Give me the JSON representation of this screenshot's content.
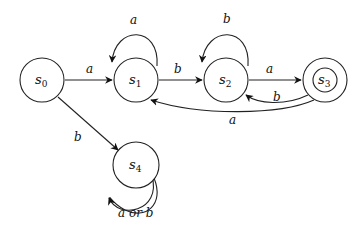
{
  "diagram": {
    "type": "finite-state-automaton",
    "states": [
      {
        "id": "s0",
        "name": "s",
        "sub": "0",
        "accepting": false,
        "start": true
      },
      {
        "id": "s1",
        "name": "s",
        "sub": "1",
        "accepting": false
      },
      {
        "id": "s2",
        "name": "s",
        "sub": "2",
        "accepting": false
      },
      {
        "id": "s3",
        "name": "s",
        "sub": "3",
        "accepting": true
      },
      {
        "id": "s4",
        "name": "s",
        "sub": "4",
        "accepting": false
      }
    ],
    "transitions": [
      {
        "from": "s0",
        "to": "s1",
        "label": "a"
      },
      {
        "from": "s0",
        "to": "s4",
        "label": "b"
      },
      {
        "from": "s1",
        "to": "s1",
        "label": "a"
      },
      {
        "from": "s1",
        "to": "s2",
        "label": "b"
      },
      {
        "from": "s2",
        "to": "s2",
        "label": "b"
      },
      {
        "from": "s2",
        "to": "s3",
        "label": "a"
      },
      {
        "from": "s3",
        "to": "s2",
        "label": "b"
      },
      {
        "from": "s3",
        "to": "s1",
        "label": "a"
      },
      {
        "from": "s4",
        "to": "s4",
        "label": "a or b"
      }
    ]
  }
}
